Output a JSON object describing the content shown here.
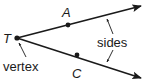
{
  "diagram": {
    "points": {
      "vertex": {
        "label": "T"
      },
      "upper": {
        "label": "A"
      },
      "lower": {
        "label": "C"
      }
    },
    "annotations": {
      "sides_label": "sides",
      "vertex_label": "vertex"
    },
    "colors": {
      "stroke": "#1a1a1a",
      "background": "#ffffff"
    }
  }
}
